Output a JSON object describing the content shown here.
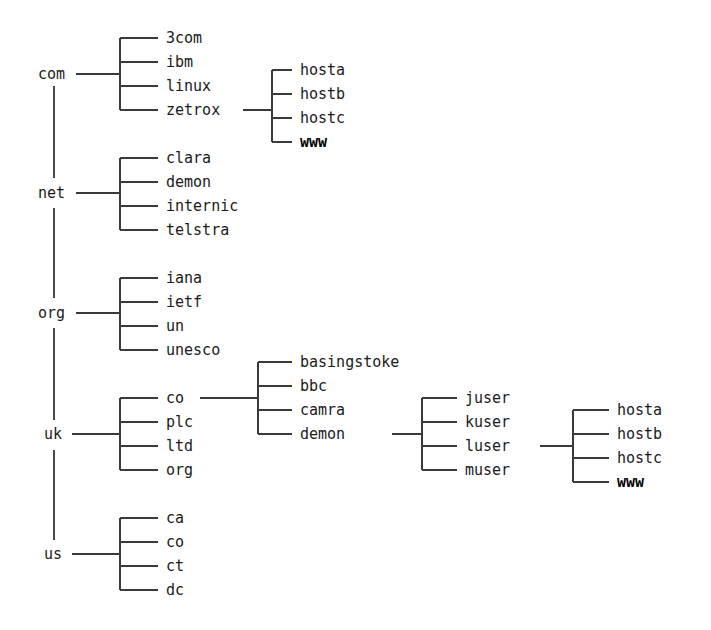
{
  "diagram": {
    "type": "tree",
    "background_color": "#ffffff",
    "line_color": "#3a3a3a",
    "text_color": "#1a1a1a"
  },
  "tlds": [
    {
      "label": "com",
      "x": 38,
      "y": 74
    },
    {
      "label": "net",
      "x": 38,
      "y": 193
    },
    {
      "label": "org",
      "x": 38,
      "y": 313
    },
    {
      "label": "uk",
      "x": 44,
      "y": 434
    },
    {
      "label": "us",
      "x": 44,
      "y": 554
    }
  ],
  "groups": [
    {
      "name": "com-children",
      "parent": "com",
      "bar_x": 120,
      "text_x": 166,
      "stub_from": 76,
      "stub_y": 74,
      "children": [
        {
          "label": "3com",
          "y": 38,
          "bold": false
        },
        {
          "label": "ibm",
          "y": 62,
          "bold": false
        },
        {
          "label": "linux",
          "y": 86,
          "bold": false
        },
        {
          "label": "zetrox",
          "y": 110,
          "bold": false
        }
      ]
    },
    {
      "name": "zetrox-children",
      "parent": "zetrox",
      "bar_x": 272,
      "text_x": 300,
      "stub_from": 243,
      "stub_y": 110,
      "children": [
        {
          "label": "hosta",
          "y": 70,
          "bold": false
        },
        {
          "label": "hostb",
          "y": 94,
          "bold": false
        },
        {
          "label": "hostc",
          "y": 118,
          "bold": false
        },
        {
          "label": "www",
          "y": 142,
          "bold": true
        }
      ]
    },
    {
      "name": "net-children",
      "parent": "net",
      "bar_x": 120,
      "text_x": 166,
      "stub_from": 76,
      "stub_y": 193,
      "children": [
        {
          "label": "clara",
          "y": 158,
          "bold": false
        },
        {
          "label": "demon",
          "y": 182,
          "bold": false
        },
        {
          "label": "internic",
          "y": 206,
          "bold": false
        },
        {
          "label": "telstra",
          "y": 230,
          "bold": false
        }
      ]
    },
    {
      "name": "org-children",
      "parent": "org",
      "bar_x": 120,
      "text_x": 166,
      "stub_from": 76,
      "stub_y": 313,
      "children": [
        {
          "label": "iana",
          "y": 278,
          "bold": false
        },
        {
          "label": "ietf",
          "y": 302,
          "bold": false
        },
        {
          "label": "un",
          "y": 326,
          "bold": false
        },
        {
          "label": "unesco",
          "y": 350,
          "bold": false
        }
      ]
    },
    {
      "name": "uk-children",
      "parent": "uk",
      "bar_x": 120,
      "text_x": 166,
      "stub_from": 72,
      "stub_y": 434,
      "children": [
        {
          "label": "co",
          "y": 398,
          "bold": false
        },
        {
          "label": "plc",
          "y": 422,
          "bold": false
        },
        {
          "label": "ltd",
          "y": 446,
          "bold": false
        },
        {
          "label": "org",
          "y": 470,
          "bold": false
        }
      ]
    },
    {
      "name": "co-children",
      "parent": "co",
      "bar_x": 258,
      "text_x": 300,
      "stub_from": 200,
      "stub_y": 398,
      "children": [
        {
          "label": "basingstoke",
          "y": 362,
          "bold": false
        },
        {
          "label": "bbc",
          "y": 386,
          "bold": false
        },
        {
          "label": "camra",
          "y": 410,
          "bold": false
        },
        {
          "label": "demon",
          "y": 434,
          "bold": false
        }
      ]
    },
    {
      "name": "demon-children",
      "parent": "demon",
      "bar_x": 422,
      "text_x": 465,
      "stub_from": 392,
      "stub_y": 434,
      "children": [
        {
          "label": "juser",
          "y": 398,
          "bold": false
        },
        {
          "label": "kuser",
          "y": 422,
          "bold": false
        },
        {
          "label": "luser",
          "y": 446,
          "bold": false
        },
        {
          "label": "muser",
          "y": 470,
          "bold": false
        }
      ]
    },
    {
      "name": "luser-children",
      "parent": "luser",
      "bar_x": 573,
      "text_x": 617,
      "stub_from": 540,
      "stub_y": 446,
      "children": [
        {
          "label": "hosta",
          "y": 410,
          "bold": false
        },
        {
          "label": "hostb",
          "y": 434,
          "bold": false
        },
        {
          "label": "hostc",
          "y": 458,
          "bold": false
        },
        {
          "label": "www",
          "y": 482,
          "bold": true
        }
      ]
    },
    {
      "name": "us-children",
      "parent": "us",
      "bar_x": 120,
      "text_x": 166,
      "stub_from": 72,
      "stub_y": 554,
      "children": [
        {
          "label": "ca",
          "y": 518,
          "bold": false
        },
        {
          "label": "co",
          "y": 542,
          "bold": false
        },
        {
          "label": "ct",
          "y": 566,
          "bold": false
        },
        {
          "label": "dc",
          "y": 590,
          "bold": false
        }
      ]
    }
  ],
  "spine": {
    "x": 54,
    "segments": [
      {
        "from": 86,
        "to": 178
      },
      {
        "from": 208,
        "to": 298
      },
      {
        "from": 328,
        "to": 420
      },
      {
        "from": 450,
        "to": 540
      }
    ]
  }
}
